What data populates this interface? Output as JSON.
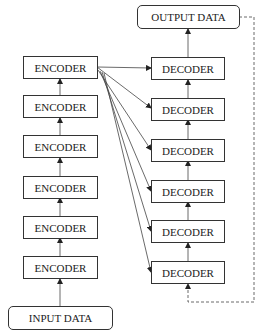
{
  "diagram": {
    "type": "encoder-decoder architecture",
    "output": {
      "label": "OUTPUT DATA"
    },
    "input": {
      "label": "INPUT DATA"
    },
    "encoders": [
      {
        "label": "ENCODER"
      },
      {
        "label": "ENCODER"
      },
      {
        "label": "ENCODER"
      },
      {
        "label": "ENCODER"
      },
      {
        "label": "ENCODER"
      },
      {
        "label": "ENCODER"
      }
    ],
    "decoders": [
      {
        "label": "DECODER"
      },
      {
        "label": "DECODER"
      },
      {
        "label": "DECODER"
      },
      {
        "label": "DECODER"
      },
      {
        "label": "DECODER"
      },
      {
        "label": "DECODER"
      }
    ],
    "edges": {
      "encoder_stack": "input -> encoder6 -> encoder5 -> ... -> encoder1",
      "encoder_to_decoders": "top encoder -> each of 6 decoders",
      "decoder_stack": "decoder6 -> ... -> decoder1 -> output",
      "feedback": "output -> decoder6 (dashed)"
    },
    "colors": {
      "stroke": "#333333",
      "background": "#ffffff"
    }
  }
}
